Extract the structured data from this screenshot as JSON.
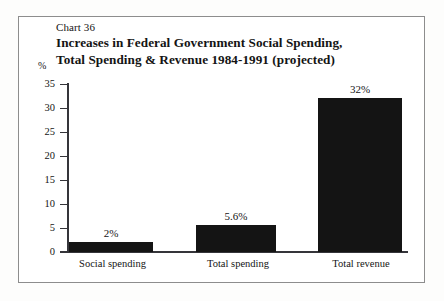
{
  "figure": {
    "chart_number": "Chart 36",
    "title_line_1": "Increases in Federal Government Social Spending,",
    "title_line_2": "Total Spending & Revenue 1984-1991 (projected)",
    "axis_unit": "%"
  },
  "chart_data": {
    "type": "bar",
    "title": "Increases in Federal Government Social Spending, Total Spending & Revenue 1984-1991 (projected)",
    "categories": [
      "Social spending",
      "Total spending",
      "Total revenue"
    ],
    "values": [
      2,
      5.6,
      32
    ],
    "value_labels": [
      "2%",
      "5.6%",
      "32%"
    ],
    "xlabel": "",
    "ylabel": "%",
    "ylim": [
      0,
      35
    ],
    "yticks": [
      0,
      5,
      10,
      15,
      20,
      25,
      30,
      35
    ],
    "ytick_labels": [
      "0",
      "5",
      "10",
      "15",
      "20",
      "25",
      "30",
      "35"
    ],
    "grid": false,
    "legend": false,
    "bar_color": "#141414"
  }
}
